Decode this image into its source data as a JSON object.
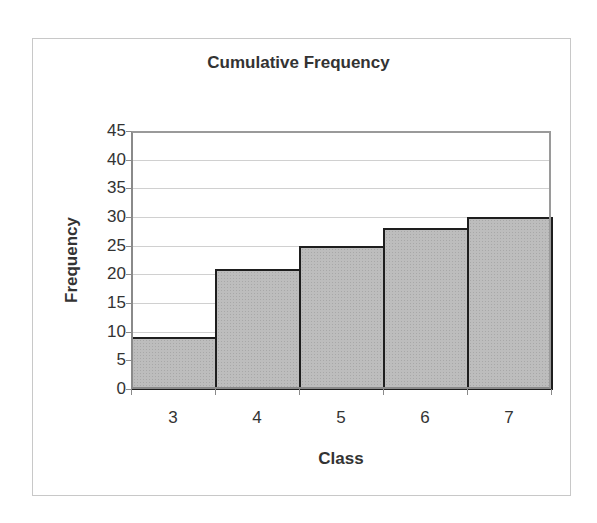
{
  "chart_data": {
    "type": "bar",
    "title": "Cumulative Frequency",
    "xlabel": "Class",
    "ylabel": "Frequency",
    "categories": [
      "3",
      "4",
      "5",
      "6",
      "7"
    ],
    "values": [
      9,
      21,
      25,
      28,
      30
    ],
    "ylim": [
      0,
      45
    ],
    "yticks": [
      0,
      5,
      10,
      15,
      20,
      25,
      30,
      35,
      40,
      45
    ],
    "grid": true,
    "legend": "none",
    "bar_gap": 0,
    "colors": {
      "bar_fill": "#bdbdbd",
      "bar_border": "#1e1e1e",
      "grid": "#d0d0d0"
    }
  }
}
